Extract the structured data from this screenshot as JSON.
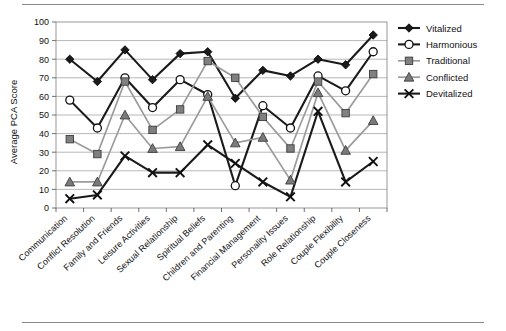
{
  "chart_data": {
    "type": "line",
    "title": "",
    "xlabel": "",
    "ylabel": "Average PCA Score",
    "ylim": [
      0,
      100
    ],
    "ytick_step": 10,
    "yticks": [
      "0",
      "10",
      "20",
      "30",
      "40",
      "50",
      "60",
      "70",
      "80",
      "90",
      "100"
    ],
    "grid": true,
    "legend_position": "right",
    "categories": [
      "Communication",
      "Conflict Resolution",
      "Family and Friends",
      "Leisure Activities",
      "Sexual Relationship",
      "Spiritual Beliefs",
      "Children and Parenting",
      "Financial Management",
      "Personality Issues",
      "Role Relationship",
      "Couple Flexibility",
      "Couple Closeness"
    ],
    "series": [
      {
        "name": "Vitalized",
        "marker": "diamond-filled",
        "color": "#1a1a1a",
        "line_color": "#1a1a1a",
        "values": [
          80,
          68,
          85,
          69,
          83,
          84,
          59,
          74,
          71,
          80,
          77,
          93
        ]
      },
      {
        "name": "Harmonious",
        "marker": "circle-open",
        "color": "#ffffff",
        "line_color": "#1a1a1a",
        "values": [
          58,
          43,
          70,
          54,
          69,
          61,
          12,
          55,
          43,
          71,
          63,
          84
        ]
      },
      {
        "name": "Traditional",
        "marker": "square-filled",
        "color": "#808080",
        "line_color": "#9b9b9b",
        "values": [
          37,
          29,
          68,
          42,
          53,
          79,
          70,
          49,
          32,
          68,
          51,
          72
        ]
      },
      {
        "name": "Conflicted",
        "marker": "triangle-filled",
        "color": "#7a7a7a",
        "line_color": "#9b9b9b",
        "values": [
          14,
          14,
          50,
          32,
          33,
          60,
          35,
          38,
          15,
          62,
          31,
          47
        ]
      },
      {
        "name": "Devitalized",
        "marker": "x-cross",
        "color": "#1a1a1a",
        "line_color": "#1a1a1a",
        "values": [
          5,
          7,
          28,
          19,
          19,
          34,
          24,
          14,
          6,
          52,
          14,
          25
        ]
      }
    ]
  },
  "legend": {
    "entries": [
      "Vitalized",
      "Harmonious",
      "Traditional",
      "Conflicted",
      "Devitalized"
    ]
  },
  "axis": {
    "y_title": "Average PCA Score"
  }
}
